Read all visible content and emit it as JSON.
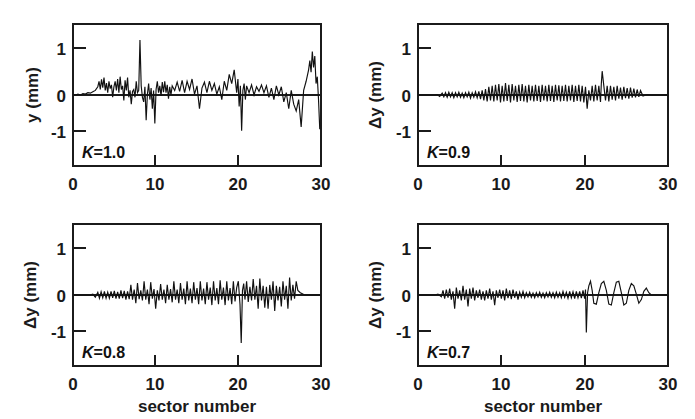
{
  "figure": {
    "name": "sector-number-oscillation-panels",
    "background_color": "#ffffff",
    "line_color": "#111111",
    "text_color": "#1a1a1a",
    "shared_xlabel": "sector number",
    "x_tick_labels": [
      "0",
      "10",
      "20",
      "30"
    ],
    "x_tick_values": [
      0,
      10,
      20,
      30
    ],
    "y_tick_labels": [
      "1",
      "0",
      "-1"
    ],
    "y_tick_values": [
      1,
      0,
      -1
    ]
  },
  "panels": [
    {
      "id": "panel-k-1-0",
      "position": "top-left",
      "k_symbol": "K",
      "k_equals": "=",
      "k_value": "1.0",
      "k_label": "K=1.0",
      "ylabel": "y (mm)",
      "xlabel": "",
      "show_xlabel": false
    },
    {
      "id": "panel-k-0-9",
      "position": "top-right",
      "k_symbol": "K",
      "k_equals": "=",
      "k_value": "0.9",
      "k_label": "K=0.9",
      "ylabel": "Δy (mm)",
      "xlabel": "",
      "show_xlabel": false
    },
    {
      "id": "panel-k-0-8",
      "position": "bottom-left",
      "k_symbol": "K",
      "k_equals": "=",
      "k_value": "0.8",
      "k_label": "K=0.8",
      "ylabel": "Δy (mm)",
      "xlabel": "sector number",
      "show_xlabel": true
    },
    {
      "id": "panel-k-0-7",
      "position": "bottom-right",
      "k_symbol": "K",
      "k_equals": "=",
      "k_value": "0.7",
      "k_label": "K=0.7",
      "ylabel": "Δy (mm)",
      "xlabel": "sector number",
      "show_xlabel": true
    }
  ],
  "chart_data": [
    {
      "type": "line",
      "title": "K=1.0",
      "xlabel": "sector number",
      "ylabel": "y (mm)",
      "xlim": [
        0,
        30
      ],
      "ylim": [
        -1.55,
        1.55
      ],
      "xticks": [
        0,
        10,
        20,
        30
      ],
      "yticks": [
        -1,
        0,
        1
      ],
      "grid": false,
      "legend": "none",
      "annotations": [
        "K=1.0"
      ],
      "x": [
        0.0,
        0.3,
        0.6,
        0.9,
        1.2,
        1.5,
        1.8,
        2.1,
        2.4,
        2.7,
        3.0,
        3.15,
        3.3,
        3.45,
        3.6,
        3.75,
        3.9,
        4.05,
        4.2,
        4.35,
        4.5,
        4.65,
        4.8,
        4.95,
        5.1,
        5.25,
        5.4,
        5.55,
        5.7,
        5.85,
        6.0,
        6.15,
        6.3,
        6.45,
        6.6,
        6.75,
        6.9,
        7.05,
        7.2,
        7.35,
        7.5,
        7.65,
        7.8,
        7.95,
        8.1,
        8.25,
        8.4,
        8.55,
        8.7,
        8.85,
        9.0,
        9.15,
        9.3,
        9.45,
        9.6,
        9.75,
        9.9,
        10.05,
        10.2,
        10.35,
        10.5,
        10.65,
        10.8,
        10.95,
        11.1,
        11.25,
        11.4,
        11.55,
        11.7,
        11.85,
        12.0,
        12.3,
        12.6,
        12.9,
        13.2,
        13.5,
        13.8,
        14.1,
        14.4,
        14.7,
        15.0,
        15.3,
        15.6,
        15.9,
        16.2,
        16.5,
        16.8,
        17.1,
        17.4,
        17.7,
        18.0,
        18.3,
        18.6,
        18.9,
        19.2,
        19.5,
        19.8,
        19.95,
        20.1,
        20.25,
        20.4,
        20.55,
        20.7,
        20.85,
        21.0,
        21.3,
        21.6,
        21.9,
        22.2,
        22.5,
        22.8,
        23.1,
        23.4,
        23.7,
        24.0,
        24.3,
        24.6,
        24.9,
        25.2,
        25.5,
        25.8,
        26.1,
        26.4,
        26.7,
        27.0,
        27.3,
        27.6,
        27.9,
        28.2,
        28.5,
        28.65,
        28.8,
        28.95,
        29.1,
        29.25,
        29.4,
        29.55,
        29.7,
        29.85,
        30.0
      ],
      "y": [
        0.0,
        0.0,
        0.02,
        0.0,
        0.03,
        0.02,
        0.05,
        0.04,
        0.07,
        0.1,
        0.18,
        0.3,
        0.12,
        0.34,
        0.16,
        0.38,
        0.1,
        0.26,
        0.05,
        0.3,
        0.14,
        0.22,
        -0.05,
        0.18,
        0.3,
        0.1,
        0.35,
        0.05,
        0.4,
        0.12,
        0.2,
        -0.12,
        0.32,
        0.1,
        0.38,
        -0.05,
        0.1,
        -0.2,
        0.08,
        0.12,
        -0.05,
        0.3,
        0.05,
        0.1,
        1.2,
        0.2,
        -0.05,
        -0.15,
        0.18,
        -0.55,
        0.02,
        0.25,
        -0.1,
        0.15,
        -0.3,
        0.1,
        -0.62,
        0.12,
        0.3,
        0.05,
        0.2,
        -0.02,
        0.28,
        0.06,
        0.3,
        0.05,
        0.22,
        -0.08,
        0.18,
        0.0,
        0.2,
        0.1,
        0.28,
        0.08,
        0.32,
        0.05,
        0.3,
        0.12,
        0.35,
        0.02,
        0.2,
        -0.3,
        0.15,
        0.28,
        0.05,
        0.3,
        0.1,
        0.25,
        0.02,
        0.18,
        -0.1,
        0.3,
        0.1,
        0.45,
        0.25,
        0.55,
        0.05,
        0.35,
        -0.25,
        0.2,
        -0.78,
        0.1,
        0.25,
        -0.1,
        0.2,
        0.05,
        0.22,
        0.0,
        0.18,
        0.08,
        0.22,
        0.05,
        0.2,
        -0.05,
        0.15,
        -0.1,
        0.2,
        0.0,
        0.18,
        -0.15,
        0.05,
        -0.3,
        0.1,
        -0.2,
        -0.35,
        -0.1,
        -0.7,
        0.1,
        0.3,
        0.55,
        0.75,
        0.5,
        0.95,
        0.6,
        0.85,
        0.25,
        0.4,
        -0.1,
        -0.75
      ]
    },
    {
      "type": "line",
      "title": "K=0.9",
      "xlabel": "sector number",
      "ylabel": "Δy (mm)",
      "xlim": [
        0,
        30
      ],
      "ylim": [
        -1.55,
        1.55
      ],
      "xticks": [
        0,
        10,
        20,
        30
      ],
      "yticks": [
        -1,
        0,
        1
      ],
      "grid": false,
      "legend": "none",
      "annotations": [
        "K=0.9"
      ],
      "x": [
        0.0,
        0.5,
        1.0,
        1.5,
        2.0,
        2.3,
        2.6,
        2.9,
        3.1,
        3.3,
        3.5,
        3.7,
        3.9,
        4.1,
        4.3,
        4.5,
        4.7,
        4.9,
        5.1,
        5.3,
        5.5,
        5.7,
        5.9,
        6.1,
        6.3,
        6.5,
        6.7,
        6.9,
        7.1,
        7.3,
        7.5,
        7.7,
        7.9,
        8.1,
        8.3,
        8.5,
        8.7,
        8.9,
        9.1,
        9.3,
        9.5,
        9.7,
        9.9,
        10.1,
        10.3,
        10.5,
        10.7,
        10.9,
        11.1,
        11.3,
        11.5,
        11.7,
        11.9,
        12.1,
        12.3,
        12.5,
        12.7,
        12.9,
        13.1,
        13.3,
        13.5,
        13.7,
        13.9,
        14.1,
        14.3,
        14.5,
        14.7,
        14.9,
        15.1,
        15.3,
        15.5,
        15.7,
        15.9,
        16.1,
        16.3,
        16.5,
        16.7,
        16.9,
        17.1,
        17.3,
        17.5,
        17.7,
        17.9,
        18.1,
        18.3,
        18.5,
        18.7,
        18.9,
        19.1,
        19.3,
        19.5,
        19.7,
        19.9,
        20.1,
        20.3,
        20.5,
        20.7,
        20.9,
        21.1,
        21.3,
        21.5,
        21.7,
        21.9,
        22.0,
        22.1,
        22.3,
        22.5,
        22.7,
        22.9,
        23.1,
        23.3,
        23.5,
        23.7,
        23.9,
        24.1,
        24.3,
        24.5,
        24.7,
        24.9,
        25.1,
        25.3,
        25.5,
        25.7,
        25.9,
        26.1,
        26.3,
        26.5,
        26.7,
        27.0,
        27.5,
        28.0,
        28.5,
        29.0,
        29.5,
        30.0
      ],
      "y": [
        0.0,
        0.0,
        0.0,
        0.0,
        0.0,
        0.01,
        -0.03,
        0.04,
        -0.04,
        0.05,
        -0.05,
        0.06,
        -0.04,
        0.05,
        -0.06,
        0.05,
        -0.04,
        0.06,
        -0.05,
        0.04,
        -0.06,
        0.05,
        -0.04,
        0.06,
        -0.07,
        0.05,
        -0.05,
        0.07,
        -0.06,
        0.08,
        -0.09,
        0.1,
        -0.12,
        0.13,
        -0.14,
        0.18,
        -0.12,
        0.2,
        -0.14,
        0.22,
        -0.12,
        0.24,
        -0.16,
        0.2,
        -0.14,
        0.26,
        -0.13,
        0.22,
        -0.16,
        0.24,
        -0.12,
        0.2,
        -0.15,
        0.22,
        -0.13,
        0.24,
        -0.14,
        0.2,
        -0.16,
        0.22,
        -0.12,
        0.2,
        -0.14,
        0.22,
        -0.13,
        0.2,
        -0.15,
        0.22,
        -0.12,
        0.2,
        -0.14,
        0.22,
        -0.13,
        0.2,
        -0.15,
        0.22,
        -0.12,
        0.21,
        -0.14,
        0.2,
        -0.13,
        0.22,
        -0.14,
        0.2,
        -0.12,
        0.22,
        -0.15,
        0.2,
        -0.13,
        0.22,
        -0.14,
        0.2,
        -0.16,
        0.18,
        -0.3,
        0.1,
        -0.12,
        0.2,
        -0.14,
        0.22,
        -0.12,
        0.2,
        -0.15,
        0.25,
        0.52,
        0.2,
        -0.12,
        0.2,
        -0.14,
        0.2,
        -0.1,
        0.18,
        -0.12,
        0.2,
        -0.08,
        0.16,
        -0.1,
        0.18,
        -0.07,
        0.15,
        -0.08,
        0.16,
        -0.06,
        0.14,
        -0.05,
        0.12,
        -0.04,
        0.1,
        -0.02,
        0.01,
        0.0,
        0.0,
        0.0,
        0.0,
        0.0
      ]
    },
    {
      "type": "line",
      "title": "K=0.8",
      "xlabel": "sector number",
      "ylabel": "Δy (mm)",
      "xlim": [
        0,
        30
      ],
      "ylim": [
        -1.55,
        1.55
      ],
      "xticks": [
        0,
        10,
        20,
        30
      ],
      "yticks": [
        -1,
        0,
        1
      ],
      "grid": false,
      "legend": "none",
      "annotations": [
        "K=0.8"
      ],
      "x": [
        0.0,
        0.5,
        1.0,
        1.5,
        2.0,
        2.4,
        2.7,
        3.0,
        3.2,
        3.4,
        3.6,
        3.8,
        4.0,
        4.2,
        4.4,
        4.6,
        4.8,
        5.0,
        5.2,
        5.4,
        5.6,
        5.8,
        6.0,
        6.2,
        6.4,
        6.6,
        6.8,
        7.0,
        7.2,
        7.4,
        7.6,
        7.8,
        8.0,
        8.2,
        8.4,
        8.6,
        8.8,
        9.0,
        9.2,
        9.4,
        9.6,
        9.8,
        10.0,
        10.2,
        10.4,
        10.6,
        10.8,
        11.0,
        11.2,
        11.4,
        11.6,
        11.8,
        12.0,
        12.2,
        12.4,
        12.6,
        12.8,
        13.0,
        13.2,
        13.4,
        13.6,
        13.8,
        14.0,
        14.2,
        14.4,
        14.6,
        14.8,
        15.0,
        15.2,
        15.4,
        15.6,
        15.8,
        16.0,
        16.2,
        16.4,
        16.6,
        16.8,
        17.0,
        17.2,
        17.4,
        17.6,
        17.8,
        18.0,
        18.2,
        18.4,
        18.6,
        18.8,
        19.0,
        19.2,
        19.4,
        19.6,
        19.8,
        20.0,
        20.2,
        20.35,
        20.5,
        20.65,
        20.8,
        21.0,
        21.2,
        21.4,
        21.6,
        21.8,
        22.0,
        22.2,
        22.4,
        22.6,
        22.8,
        23.0,
        23.2,
        23.4,
        23.6,
        23.8,
        24.0,
        24.2,
        24.4,
        24.6,
        24.8,
        25.0,
        25.2,
        25.4,
        25.6,
        25.8,
        26.0,
        26.2,
        26.4,
        26.6,
        26.8,
        27.0,
        27.2,
        27.5,
        27.8,
        28.0,
        28.5,
        29.0,
        29.5,
        30.0
      ],
      "y": [
        0.0,
        0.0,
        0.0,
        0.0,
        0.0,
        0.02,
        -0.05,
        0.06,
        -0.07,
        0.07,
        -0.06,
        0.08,
        -0.07,
        0.06,
        -0.07,
        0.08,
        -0.06,
        0.09,
        -0.08,
        0.07,
        -0.08,
        0.1,
        -0.07,
        0.09,
        -0.1,
        0.08,
        -0.09,
        0.22,
        -0.1,
        0.12,
        -0.18,
        0.26,
        -0.09,
        0.1,
        -0.12,
        0.3,
        -0.1,
        0.12,
        -0.2,
        0.28,
        -0.08,
        0.13,
        -0.3,
        0.1,
        -0.12,
        0.24,
        -0.1,
        0.12,
        -0.18,
        0.22,
        -0.1,
        0.13,
        -0.16,
        0.3,
        -0.1,
        0.12,
        -0.18,
        0.26,
        -0.1,
        0.14,
        -0.2,
        0.3,
        -0.12,
        0.14,
        -0.18,
        0.28,
        -0.1,
        0.15,
        -0.2,
        0.3,
        -0.12,
        0.14,
        -0.2,
        0.28,
        -0.1,
        0.16,
        -0.22,
        0.3,
        -0.12,
        0.15,
        -0.2,
        0.32,
        -0.1,
        0.16,
        -0.22,
        0.3,
        -0.12,
        0.15,
        -0.2,
        0.3,
        -0.14,
        0.16,
        0.3,
        -0.2,
        -1.05,
        0.1,
        0.25,
        -0.1,
        0.3,
        -0.15,
        0.18,
        -0.12,
        0.35,
        -0.1,
        0.2,
        -0.3,
        0.36,
        -0.12,
        0.2,
        -0.28,
        0.18,
        -0.3,
        0.22,
        -0.1,
        0.3,
        -0.35,
        0.2,
        -0.12,
        0.18,
        -0.25,
        0.3,
        -0.1,
        0.2,
        -0.3,
        0.38,
        -0.12,
        0.22,
        -0.08,
        0.3,
        0.1,
        0.05,
        0.02,
        0.0,
        0.0,
        0.0,
        0.0,
        0.0
      ]
    },
    {
      "type": "line",
      "title": "K=0.7",
      "xlabel": "sector number",
      "ylabel": "Δy (mm)",
      "xlim": [
        0,
        30
      ],
      "ylim": [
        -1.55,
        1.55
      ],
      "xticks": [
        0,
        10,
        20,
        30
      ],
      "yticks": [
        -1,
        0,
        1
      ],
      "grid": false,
      "legend": "none",
      "annotations": [
        "K=0.7"
      ],
      "x": [
        0.0,
        0.5,
        1.0,
        1.5,
        2.0,
        2.4,
        2.8,
        3.0,
        3.2,
        3.4,
        3.6,
        3.8,
        4.0,
        4.2,
        4.4,
        4.6,
        4.8,
        5.0,
        5.2,
        5.4,
        5.6,
        5.8,
        6.0,
        6.2,
        6.4,
        6.6,
        6.8,
        7.0,
        7.2,
        7.4,
        7.6,
        7.8,
        8.0,
        8.2,
        8.4,
        8.6,
        8.8,
        9.0,
        9.2,
        9.4,
        9.6,
        9.8,
        10.0,
        10.2,
        10.4,
        10.6,
        10.8,
        11.0,
        11.2,
        11.4,
        11.6,
        11.8,
        12.0,
        12.2,
        12.4,
        12.6,
        12.8,
        13.0,
        13.2,
        13.4,
        13.6,
        13.8,
        14.0,
        14.2,
        14.4,
        14.6,
        14.8,
        15.0,
        15.2,
        15.4,
        15.6,
        15.8,
        16.0,
        16.2,
        16.4,
        16.6,
        16.8,
        17.0,
        17.2,
        17.4,
        17.6,
        17.8,
        18.0,
        18.2,
        18.4,
        18.6,
        18.8,
        19.0,
        19.2,
        19.4,
        19.6,
        19.8,
        20.0,
        20.1,
        20.2,
        20.35,
        20.5,
        20.7,
        20.9,
        21.1,
        21.4,
        21.7,
        22.0,
        22.3,
        22.6,
        22.9,
        23.2,
        23.5,
        23.8,
        24.1,
        24.4,
        24.7,
        25.0,
        25.3,
        25.6,
        25.9,
        26.2,
        26.5,
        26.8,
        27.1,
        27.4,
        27.7,
        28.0,
        28.5,
        29.0,
        29.5,
        30.0
      ],
      "y": [
        0.0,
        0.0,
        0.0,
        0.0,
        0.0,
        0.02,
        -0.04,
        0.1,
        -0.08,
        0.12,
        -0.06,
        0.14,
        -0.1,
        0.08,
        -0.3,
        0.16,
        -0.08,
        0.1,
        -0.12,
        0.2,
        -0.1,
        0.12,
        -0.25,
        0.14,
        -0.08,
        0.16,
        -0.12,
        0.1,
        -0.06,
        0.12,
        -0.1,
        0.08,
        -0.12,
        0.1,
        -0.08,
        0.14,
        -0.1,
        0.08,
        -0.22,
        0.1,
        -0.06,
        0.12,
        -0.08,
        0.1,
        -0.12,
        0.14,
        -0.07,
        0.1,
        -0.09,
        0.12,
        -0.06,
        0.08,
        -0.1,
        0.06,
        -0.05,
        0.08,
        -0.06,
        0.05,
        -0.04,
        0.06,
        -0.05,
        0.04,
        -0.06,
        0.05,
        -0.04,
        0.06,
        -0.05,
        0.04,
        -0.06,
        0.05,
        -0.04,
        0.06,
        -0.05,
        0.05,
        -0.06,
        0.06,
        -0.05,
        0.05,
        -0.06,
        0.08,
        -0.05,
        0.06,
        -0.07,
        0.08,
        -0.06,
        0.07,
        -0.08,
        0.08,
        -0.06,
        0.08,
        -0.07,
        0.1,
        -0.08,
        0.12,
        -0.82,
        0.05,
        0.2,
        0.3,
        0.1,
        -0.18,
        -0.2,
        0.05,
        0.25,
        0.3,
        0.1,
        -0.2,
        -0.22,
        0.05,
        0.28,
        0.3,
        0.05,
        -0.22,
        -0.18,
        0.1,
        0.25,
        0.2,
        0.02,
        -0.18,
        -0.1,
        0.08,
        0.15,
        0.05,
        0.0,
        0.0,
        0.0,
        0.0,
        0.0,
        0.0
      ]
    }
  ]
}
